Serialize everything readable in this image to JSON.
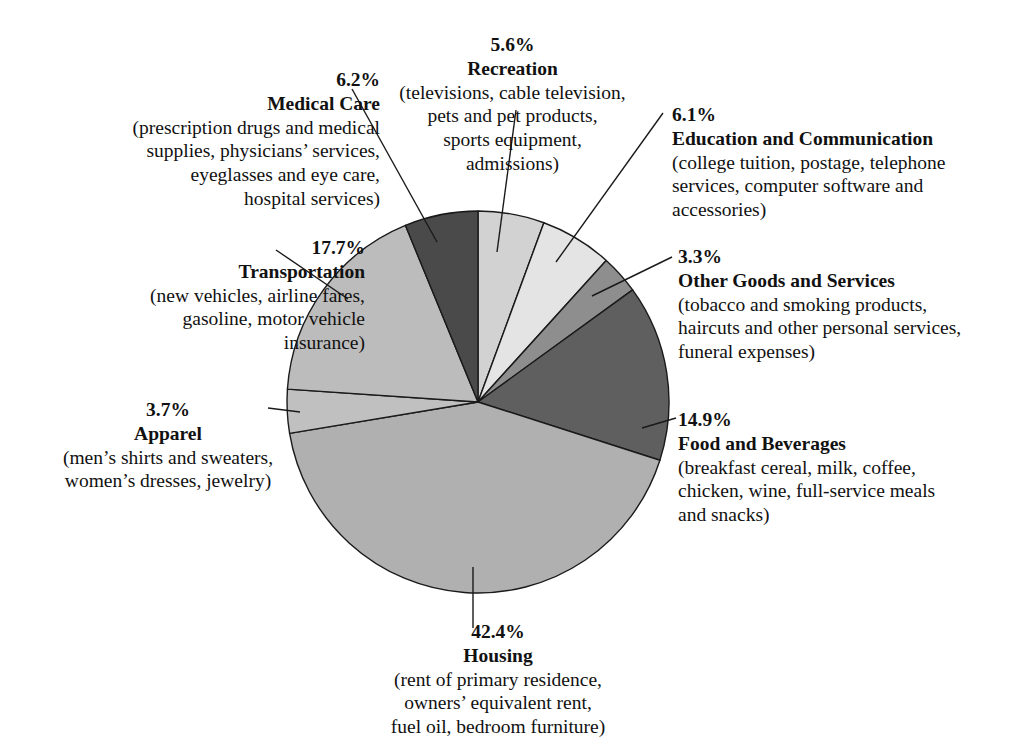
{
  "chart_data": {
    "type": "pie",
    "title": "",
    "legend_position": "callout-labels",
    "center": {
      "x": 478,
      "y": 402
    },
    "radius": 191,
    "start_angle_deg": 0,
    "direction": "clockwise",
    "total_percent": 99.9,
    "categories": [
      "Recreation",
      "Education and Communication",
      "Other Goods and Services",
      "Food and Beverages",
      "Housing",
      "Apparel",
      "Transportation",
      "Medical Care"
    ],
    "values": [
      5.6,
      6.1,
      3.3,
      14.9,
      42.4,
      3.7,
      17.7,
      6.2
    ],
    "slices": [
      {
        "name": "Recreation",
        "percent": "5.6%",
        "value": 5.6,
        "color": "#d2d2d2",
        "description": "(televisions, cable television, pets and pet products, sports equipment, admissions)"
      },
      {
        "name": "Education and Communication",
        "percent": "6.1%",
        "value": 6.1,
        "color": "#e4e4e4",
        "description": "(college tuition, postage, telephone services, computer software and accessories)"
      },
      {
        "name": "Other Goods and Services",
        "percent": "3.3%",
        "value": 3.3,
        "color": "#8e8e8e",
        "description": "(tobacco and smoking products, haircuts and other personal services, funeral expenses)"
      },
      {
        "name": "Food and Beverages",
        "percent": "14.9%",
        "value": 14.9,
        "color": "#5f5f5f",
        "description": "(breakfast cereal, milk, coffee, chicken, wine, full-service meals and snacks)"
      },
      {
        "name": "Housing",
        "percent": "42.4%",
        "value": 42.4,
        "color": "#b0b0b0",
        "description": "(rent of primary residence, owners' equivalent rent, fuel oil, bedroom furniture)"
      },
      {
        "name": "Apparel",
        "percent": "3.7%",
        "value": 3.7,
        "color": "#c0c0c0",
        "description": "(men's shirts and sweaters, women's dresses, jewelry)"
      },
      {
        "name": "Transportation",
        "percent": "17.7%",
        "value": 17.7,
        "color": "#bcbcbc",
        "description": "(new vehicles, airline fares, gasoline, motor vehicle insurance)"
      },
      {
        "name": "Medical Care",
        "percent": "6.2%",
        "value": 6.2,
        "color": "#4a4a4a",
        "description": "(prescription drugs and medical supplies, physicians' services, eyeglasses and eye care, hospital services)"
      }
    ]
  },
  "labels": {
    "medical": {
      "pct": "6.2%",
      "cat": "Medical Care",
      "line1": "(prescription drugs and medical",
      "line2": "supplies, physicians’ services,",
      "line3": "eyeglasses and eye care,",
      "line4": "hospital services)"
    },
    "recreation": {
      "pct": "5.6%",
      "cat": "Recreation",
      "line1": "(televisions, cable television,",
      "line2": "pets and pet products,",
      "line3": "sports equipment,",
      "line4": "admissions)"
    },
    "education": {
      "pct": "6.1%",
      "cat": "Education and Communication",
      "line1": "(college tuition, postage, telephone",
      "line2": "services, computer software and",
      "line3": "accessories)"
    },
    "other": {
      "pct": "3.3%",
      "cat": "Other Goods and Services",
      "line1": "(tobacco and smoking products,",
      "line2": "haircuts and other personal services,",
      "line3": "funeral expenses)"
    },
    "transportation": {
      "pct": "17.7%",
      "cat": "Transportation",
      "line1": "(new vehicles, airline fares,",
      "line2": "gasoline, motor vehicle",
      "line3": "insurance)"
    },
    "food": {
      "pct": "14.9%",
      "cat": "Food and Beverages",
      "line1": "(breakfast cereal, milk, coffee,",
      "line2": "chicken, wine, full-service meals",
      "line3": "and snacks)"
    },
    "apparel": {
      "pct": "3.7%",
      "cat": "Apparel",
      "line1": "(men’s shirts and sweaters,",
      "line2": "women’s dresses, jewelry)"
    },
    "housing": {
      "pct": "42.4%",
      "cat": "Housing",
      "line1": "(rent of primary residence,",
      "line2": "owners’ equivalent rent,",
      "line3": "fuel oil, bedroom furniture)"
    }
  },
  "style": {
    "outline_color": "#1a1a1a",
    "leader_color": "#1a1a1a",
    "background": "#ffffff"
  }
}
